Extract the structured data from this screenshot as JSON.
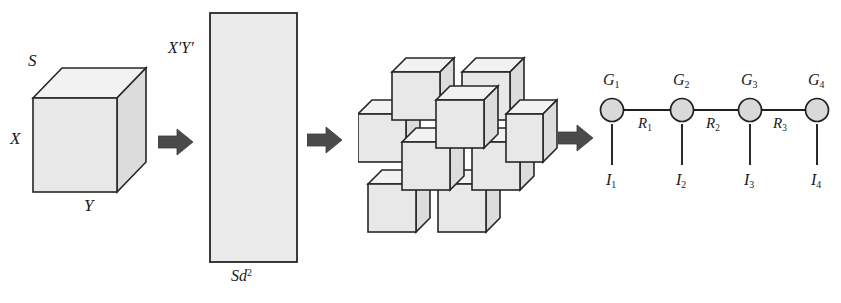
{
  "figure": {
    "background_color": "#ffffff",
    "ink_color": "#1f1f1f",
    "fill_color": "#e8e8e8"
  },
  "stage1_tensor_cube": {
    "name": "input tensor cube",
    "label_depth": "S",
    "label_height": "X",
    "label_width": "Y"
  },
  "stage2_matrix": {
    "name": "unfolded matrix",
    "label_rows": "X′Y′",
    "label_cols_prefix": "Sd",
    "label_cols_exponent": "2"
  },
  "stage3_cube_cluster": {
    "name": "cube cluster",
    "cube_count": 9
  },
  "stage4_tensor_network": {
    "name": "tensor train network",
    "nodes": [
      {
        "label": "G",
        "sub": "1"
      },
      {
        "label": "G",
        "sub": "2"
      },
      {
        "label": "G",
        "sub": "3"
      },
      {
        "label": "G",
        "sub": "4"
      }
    ],
    "edges": [
      {
        "label": "R",
        "sub": "1"
      },
      {
        "label": "R",
        "sub": "2"
      },
      {
        "label": "R",
        "sub": "3"
      }
    ],
    "legs": [
      {
        "label": "I",
        "sub": "1"
      },
      {
        "label": "I",
        "sub": "2"
      },
      {
        "label": "I",
        "sub": "3"
      },
      {
        "label": "I",
        "sub": "4"
      }
    ]
  },
  "arrows": [
    {
      "name": "arrow-1"
    },
    {
      "name": "arrow-2"
    },
    {
      "name": "arrow-3"
    }
  ]
}
